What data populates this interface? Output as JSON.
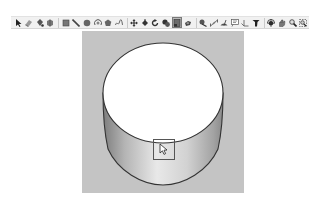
{
  "toolbar": {
    "tools": [
      {
        "name": "select",
        "icon": "arrow-icon",
        "active": false
      },
      {
        "name": "eraser",
        "icon": "eraser-icon",
        "active": false
      },
      {
        "name": "paint-bucket",
        "icon": "paint-bucket-icon",
        "active": false
      },
      {
        "name": "component",
        "icon": "component-icon",
        "active": false
      },
      {
        "sep": true
      },
      {
        "name": "rectangle",
        "icon": "rectangle-icon",
        "active": false
      },
      {
        "name": "line",
        "icon": "pencil-icon",
        "active": false
      },
      {
        "name": "circle",
        "icon": "circle-icon",
        "active": false
      },
      {
        "name": "arc",
        "icon": "arc-icon",
        "active": false
      },
      {
        "name": "polygon",
        "icon": "polygon-icon",
        "active": false
      },
      {
        "name": "freehand",
        "icon": "freehand-icon",
        "active": false
      },
      {
        "sep": true
      },
      {
        "name": "move",
        "icon": "move-icon",
        "active": false
      },
      {
        "name": "push-pull",
        "icon": "push-pull-icon",
        "active": false
      },
      {
        "name": "rotate",
        "icon": "rotate-icon",
        "active": false
      },
      {
        "name": "follow-me",
        "icon": "follow-me-icon",
        "active": false
      },
      {
        "name": "scale",
        "icon": "scale-icon",
        "active": true
      },
      {
        "name": "offset",
        "icon": "offset-icon",
        "active": false
      },
      {
        "sep": true
      },
      {
        "name": "tape-measure",
        "icon": "tape-measure-icon",
        "active": false
      },
      {
        "name": "dimension",
        "icon": "dimension-icon",
        "active": false
      },
      {
        "name": "protractor",
        "icon": "protractor-icon",
        "active": false
      },
      {
        "name": "text",
        "icon": "text-icon",
        "active": false
      },
      {
        "name": "axes",
        "icon": "axes-icon",
        "active": false
      },
      {
        "name": "3d-text",
        "icon": "3d-text-icon",
        "active": false
      },
      {
        "sep": true
      },
      {
        "name": "orbit",
        "icon": "orbit-icon",
        "active": false
      },
      {
        "name": "pan",
        "icon": "pan-icon",
        "active": false
      },
      {
        "name": "zoom",
        "icon": "zoom-icon",
        "active": false
      },
      {
        "name": "zoom-extents",
        "icon": "zoom-extents-icon",
        "active": false
      }
    ]
  },
  "colors": {
    "viewport_bg": "#c4c4c4",
    "top_face": "#ffffff",
    "edge": "#3a3a3a",
    "side_light": "#e6e6e6",
    "side_dark": "#8c8c8c",
    "selection_box": "#5a5a5a"
  },
  "viewport": {
    "model": "cylinder",
    "cursor": "scale-cursor"
  }
}
